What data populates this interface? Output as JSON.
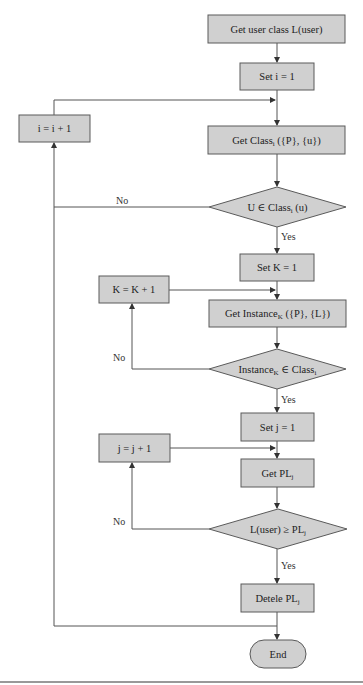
{
  "diagram": {
    "type": "flowchart",
    "nodes": {
      "get_user_class": {
        "shape": "process",
        "text": "Get user class L(user)"
      },
      "set_i": {
        "shape": "process",
        "text": "Set i = 1"
      },
      "inc_i": {
        "shape": "process",
        "text": "i = i + 1"
      },
      "get_class": {
        "shape": "process",
        "text": "Get Class",
        "sub": "i",
        "suffix": " ({P}, {u})"
      },
      "dec_u_in_class": {
        "shape": "decision",
        "text": "U ∈ Class",
        "sub": "i",
        "suffix": " (u)"
      },
      "set_k": {
        "shape": "process",
        "text": "Set K = 1"
      },
      "inc_k": {
        "shape": "process",
        "text": "K = K + 1"
      },
      "get_instance": {
        "shape": "process",
        "text": "Get Instance",
        "sub": "K",
        "suffix": " ({P}, {L})"
      },
      "dec_instance_in_class": {
        "shape": "decision",
        "text": "Instance",
        "sub": "K",
        "mid": " ∈ Class",
        "sub2": "i"
      },
      "set_j": {
        "shape": "process",
        "text": "Set j = 1"
      },
      "inc_j": {
        "shape": "process",
        "text": "j = j + 1"
      },
      "get_pl": {
        "shape": "process",
        "text": "Get PL",
        "sub": "j"
      },
      "dec_level": {
        "shape": "decision",
        "text": "L(user) ≥ PL",
        "sub": "j"
      },
      "delete_pl": {
        "shape": "process",
        "text": "Detele PL",
        "sub": "j"
      },
      "end": {
        "shape": "terminal",
        "text": "End"
      }
    },
    "edge_labels": {
      "no": "No",
      "yes": "Yes"
    },
    "edges": [
      {
        "from": "get_user_class",
        "to": "set_i"
      },
      {
        "from": "set_i",
        "to": "get_class"
      },
      {
        "from": "get_class",
        "to": "dec_u_in_class"
      },
      {
        "from": "dec_u_in_class",
        "to": "inc_i",
        "label": "No"
      },
      {
        "from": "inc_i",
        "to": "get_class"
      },
      {
        "from": "dec_u_in_class",
        "to": "set_k",
        "label": "Yes"
      },
      {
        "from": "set_k",
        "to": "get_instance"
      },
      {
        "from": "get_instance",
        "to": "dec_instance_in_class"
      },
      {
        "from": "dec_instance_in_class",
        "to": "inc_k",
        "label": "No"
      },
      {
        "from": "inc_k",
        "to": "get_instance"
      },
      {
        "from": "dec_instance_in_class",
        "to": "set_j",
        "label": "Yes"
      },
      {
        "from": "set_j",
        "to": "get_pl"
      },
      {
        "from": "get_pl",
        "to": "dec_level"
      },
      {
        "from": "dec_level",
        "to": "inc_j",
        "label": "No"
      },
      {
        "from": "inc_j",
        "to": "get_pl"
      },
      {
        "from": "dec_level",
        "to": "delete_pl",
        "label": "Yes"
      },
      {
        "from": "delete_pl",
        "to": "end"
      },
      {
        "from": "delete_pl",
        "to": "inc_i"
      }
    ]
  }
}
